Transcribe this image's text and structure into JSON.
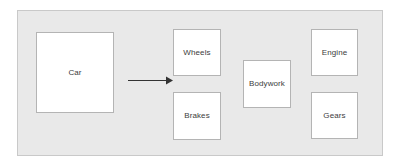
{
  "diagram": {
    "frame": {
      "name": "diagram-frame",
      "background_color": "#e9e9e9",
      "border_color": "#c9c9c9"
    },
    "node_style": {
      "fill_color": "#ffffff",
      "border_color": "#b4b4b4",
      "text_color": "#3c3c3c"
    },
    "nodes": [
      {
        "id": "car",
        "label": "Car"
      },
      {
        "id": "wheels",
        "label": "Wheels"
      },
      {
        "id": "brakes",
        "label": "Brakes"
      },
      {
        "id": "bodywork",
        "label": "Bodywork"
      },
      {
        "id": "engine",
        "label": "Engine"
      },
      {
        "id": "gears",
        "label": "Gears"
      }
    ],
    "connectors": [
      {
        "id": "car-to-parts",
        "type": "arrow",
        "from": "car",
        "to": "wheels",
        "label": "",
        "color": "#333333",
        "head": "solid-triangle"
      }
    ]
  }
}
